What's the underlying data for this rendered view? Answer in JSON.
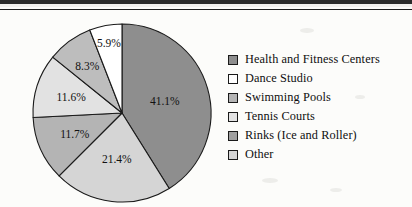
{
  "page": {
    "background_color": "#fcfcfa",
    "rule_color": "#1d1d1d"
  },
  "chart_data": {
    "type": "pie",
    "title": "",
    "subtitle": "",
    "xlabel": "",
    "ylabel": "",
    "legend_position": "right",
    "grid": false,
    "start_angle_deg": 0,
    "direction": "clockwise",
    "categories": [
      "Health and Fitness Centers",
      "Dance Studio",
      "Swimming Pools",
      "Tennis Courts",
      "Rinks (Ice and Roller)",
      "Other"
    ],
    "values": [
      41.1,
      5.9,
      11.7,
      21.4,
      8.3,
      11.6
    ],
    "slices": [
      {
        "label": "Health and Fitness Centers",
        "value": 41.1,
        "display": "41.1%",
        "color": "#8e8e8e",
        "order_clockwise_from_top": 1
      },
      {
        "label": "Tennis Courts",
        "value": 21.4,
        "display": "21.4%",
        "color": "#d5d5d5",
        "order_clockwise_from_top": 2
      },
      {
        "label": "Swimming Pools",
        "value": 11.7,
        "display": "11.7%",
        "color": "#b4b4b4",
        "order_clockwise_from_top": 3
      },
      {
        "label": "Other",
        "value": 11.6,
        "display": "11.6%",
        "color": "#e2e2e2",
        "order_clockwise_from_top": 4
      },
      {
        "label": "Rinks (Ice and Roller)",
        "value": 8.3,
        "display": "8.3%",
        "color": "#bdbdbd",
        "order_clockwise_from_top": 5
      },
      {
        "label": "Dance Studio",
        "value": 5.9,
        "display": "5.9%",
        "color": "#ffffff",
        "order_clockwise_from_top": 6
      }
    ]
  },
  "legend": {
    "items": [
      {
        "label": "Health and Fitness Centers",
        "color": "#8e8e8e"
      },
      {
        "label": "Dance Studio",
        "color": "#ffffff"
      },
      {
        "label": "Swimming Pools",
        "color": "#b4b4b4"
      },
      {
        "label": "Tennis Courts",
        "color": "#e2e2e2"
      },
      {
        "label": "Rinks (Ice and Roller)",
        "color": "#a0a0a0"
      },
      {
        "label": "Other",
        "color": "#d5d5d5"
      }
    ]
  }
}
